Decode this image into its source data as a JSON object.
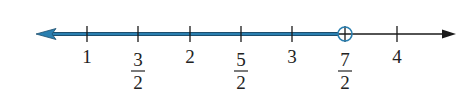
{
  "number_line": {
    "min_label": 1,
    "max_label": 4,
    "ticks": [
      {
        "value": 1,
        "label": "1",
        "num": null,
        "den": null,
        "x": 87
      },
      {
        "value": 1.5,
        "label": "3/2",
        "num": "3",
        "den": "2",
        "x": 138
      },
      {
        "value": 2,
        "label": "2",
        "num": null,
        "den": null,
        "x": 190
      },
      {
        "value": 2.5,
        "label": "5/2",
        "num": "5",
        "den": "2",
        "x": 241
      },
      {
        "value": 3,
        "label": "3",
        "num": null,
        "den": null,
        "x": 292
      },
      {
        "value": 3.5,
        "label": "7/2",
        "num": "7",
        "den": "2",
        "x": 345
      },
      {
        "value": 4,
        "label": "4",
        "num": null,
        "den": null,
        "x": 397
      }
    ],
    "shaded_ray": {
      "direction": "left",
      "endpoint_value": 3.5,
      "endpoint_label": "7/2",
      "endpoint_type": "open-circle",
      "represents": "x < 7/2"
    },
    "colors": {
      "axis": "#1a1a1a",
      "shade": "#2a7fb0",
      "shade_dark": "#1d4f6e",
      "label": "#222222"
    }
  }
}
